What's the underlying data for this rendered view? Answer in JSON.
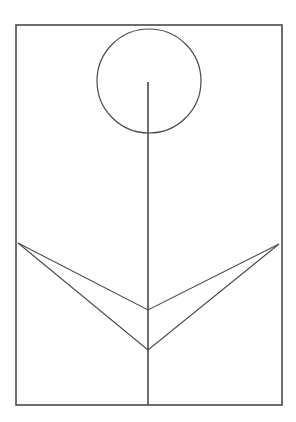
{
  "title": "Line drawing of a flower with stem and two V-shaped leaves inside a rectangular frame",
  "colors": {
    "background": "#ffffff",
    "stroke": "#4a4a4a"
  },
  "drawing": {
    "frame": {
      "x": 16,
      "y": 25,
      "width": 266,
      "height": 380
    },
    "flower_head": {
      "cx": 149,
      "cy": 81,
      "r": 52
    },
    "stem": {
      "x": 148,
      "y1": 82,
      "y2": 405
    },
    "leaves": [
      {
        "name": "upper-v",
        "left_tip": [
          18,
          243
        ],
        "vertex": [
          148,
          310
        ],
        "right_tip": [
          279,
          244
        ]
      },
      {
        "name": "lower-v",
        "left_tip": [
          18,
          243
        ],
        "vertex": [
          148,
          350
        ],
        "right_tip": [
          279,
          244
        ]
      }
    ]
  }
}
